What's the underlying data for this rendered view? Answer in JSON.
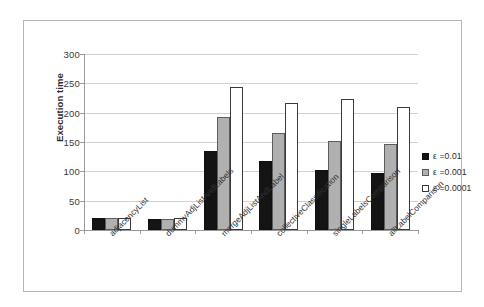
{
  "chart_data": {
    "type": "bar",
    "title": "",
    "xlabel": "",
    "ylabel": "Execution time",
    "ylim": [
      0,
      300
    ],
    "ytick_step": 50,
    "yticks": [
      0,
      50,
      100,
      150,
      200,
      250,
      300
    ],
    "grid": true,
    "legend_position": "right",
    "categories": [
      "adjacencyList",
      "dummyAdjListAndLabels",
      "mergeAdjListAndLabel",
      "collectiveClassification",
      "singleLabelsComparison",
      "allLabelComparison"
    ],
    "series": [
      {
        "name": "ε =0.01",
        "values": [
          20,
          19,
          134,
          118,
          102,
          97
        ]
      },
      {
        "name": "ε =0.001",
        "values": [
          20,
          19,
          192,
          165,
          152,
          147
        ]
      },
      {
        "name": "ε =0.0001",
        "values": [
          21,
          20,
          244,
          216,
          223,
          209
        ]
      }
    ],
    "series_colors": [
      "#141414",
      "#b0b0b0",
      "#ffffff"
    ]
  },
  "legend": {
    "entries": [
      {
        "label": "ε =0.01"
      },
      {
        "label": "ε =0.001"
      },
      {
        "label": "ε =0.0001"
      }
    ]
  },
  "axis": {
    "y_title": "Execution time",
    "y_tick_labels": [
      "300",
      "250",
      "200",
      "150",
      "100",
      "50",
      "0"
    ]
  },
  "colors": {
    "frame": "#b7b7b7",
    "gridline": "#d2d2d2",
    "axis": "#9a9a9a",
    "text": "#2b2b2b"
  }
}
